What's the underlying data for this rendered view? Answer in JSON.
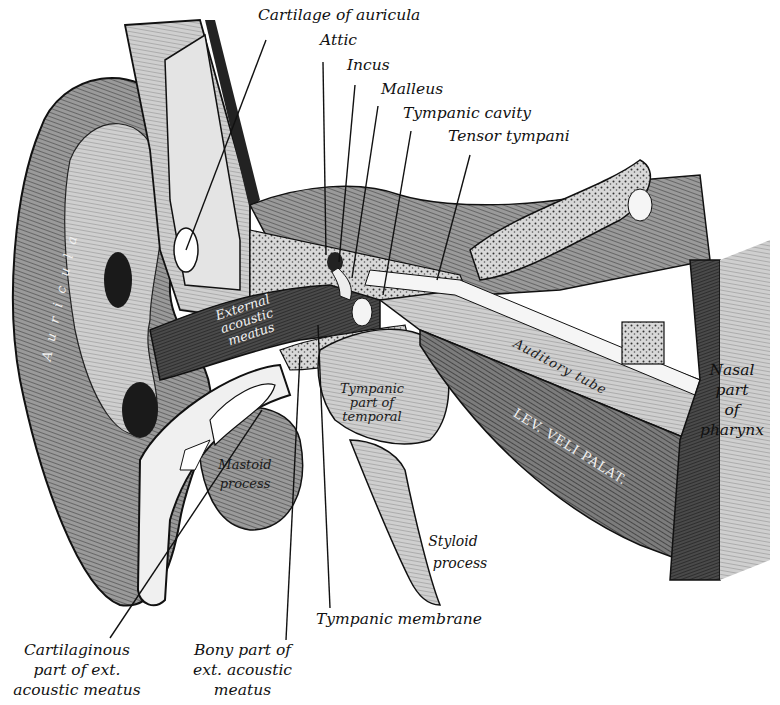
{
  "figure": {
    "colors": {
      "ink": "#111111",
      "paper": "#ffffff",
      "mid_gray": "#8a8a8a",
      "dark_gray": "#3a3a3a",
      "light_gray": "#d6d6d6"
    }
  },
  "labels": {
    "cartilage_of_auricula": "Cartilage of auricula",
    "attic": "Attic",
    "incus": "Incus",
    "malleus": "Malleus",
    "tympanic_cavity": "Tympanic cavity",
    "tensor_tympani": "Tensor tympani",
    "nasal_part": [
      "Nasal",
      "part",
      "of",
      "pharynx"
    ],
    "styloid_process": [
      "Styloid",
      "process"
    ],
    "tympanic_membrane": "Tympanic membrane",
    "cartilaginous_part": [
      "Cartilaginous",
      "part of ext.",
      "acoustic meatus"
    ],
    "bony_part": [
      "Bony part of",
      "ext. acoustic",
      "meatus"
    ]
  },
  "inline_labels": {
    "auricula": "A u r i c u l a",
    "external_acoustic_meatus": [
      "External",
      "acoustic",
      "meatus"
    ],
    "tympanic_part": [
      "Tympanic",
      "part of",
      "temporal"
    ],
    "mastoid_process": [
      "Mastoid",
      "process"
    ],
    "auditory_tube": "Auditory tube",
    "lev_veli_palat": "LEV. VELI PALAT."
  }
}
